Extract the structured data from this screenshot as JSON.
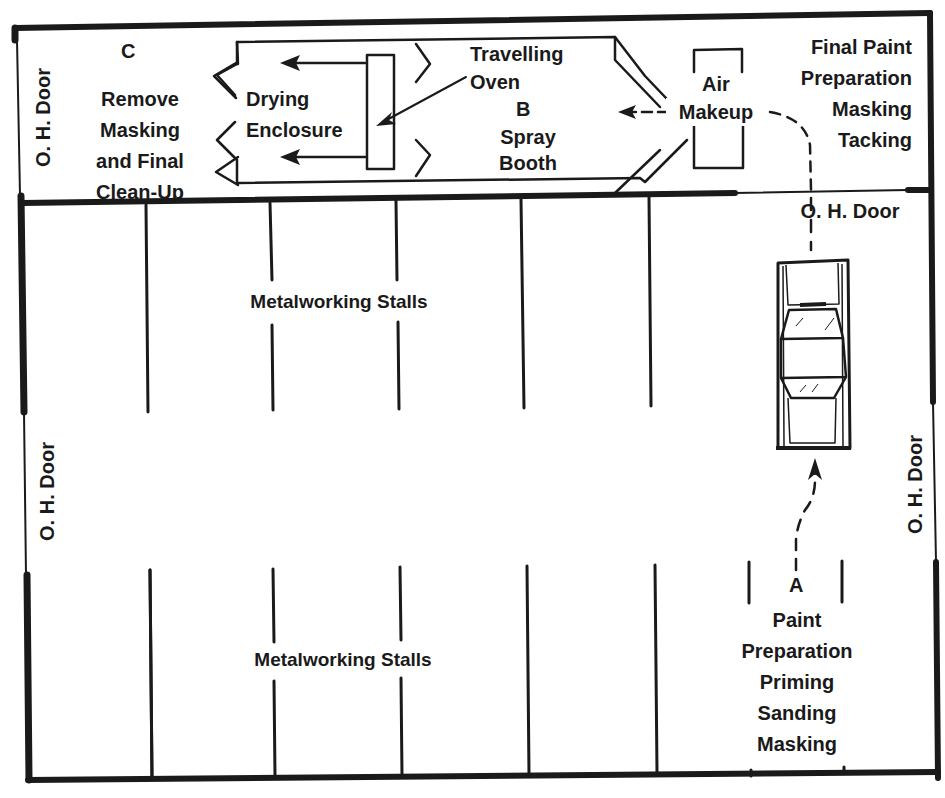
{
  "diagram": {
    "type": "floor-plan",
    "colors": {
      "line": "#1a1a1a",
      "background": "#ffffff"
    }
  },
  "areas": {
    "c": {
      "letter": "C",
      "lines": [
        "Remove",
        "Masking",
        "and Final",
        "Clean-Up"
      ]
    },
    "drying": {
      "lines": [
        "Drying",
        "Enclosure"
      ]
    },
    "oven": {
      "lines": [
        "Travelling",
        "Oven"
      ]
    },
    "b": {
      "letter": "B",
      "lines": [
        "Spray",
        "Booth"
      ]
    },
    "air_makeup": {
      "lines": [
        "Air",
        "Makeup"
      ]
    },
    "final_prep": {
      "lines": [
        "Final Paint",
        "Preparation",
        "Masking",
        "Tacking"
      ]
    },
    "a": {
      "letter": "A",
      "lines": [
        "Paint",
        "Preparation",
        "Priming",
        "Sanding",
        "Masking"
      ]
    },
    "stalls_top": {
      "label": "Metalworking Stalls"
    },
    "stalls_bottom": {
      "label": "Metalworking Stalls"
    }
  },
  "doors": {
    "top_left": "O. H. Door",
    "divider_right": "O. H. Door",
    "left_middle": "O. H. Door",
    "right_middle": "O. H. Door"
  },
  "vehicle": {
    "icon": "car-top-view-icon"
  },
  "flow": {
    "path": [
      "A",
      "car",
      "divider O. H. Door",
      "Air Makeup",
      "B",
      "Travelling Oven",
      "Drying Enclosure",
      "C"
    ]
  }
}
